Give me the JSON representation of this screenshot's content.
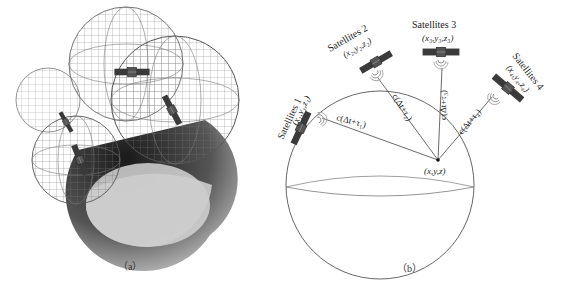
{
  "figure": {
    "panel_a": {
      "caption": "（a）",
      "description": "Overlapping wireframe spheres around Earth with satellites at their centers"
    },
    "panel_b": {
      "caption": "（b）",
      "receiver_label": "(x,y,z)",
      "satellites": [
        {
          "name": "Satellites 1",
          "coords": "(x₁,y₁,z₁)",
          "range": "c(Δt+τ₁)"
        },
        {
          "name": "Satellites 2",
          "coords": "(x₂,y₂,z₂)",
          "range": "c(Δt+τ₂)"
        },
        {
          "name": "Satellites 3",
          "coords": "(x₃,y₃,z₃)",
          "range": "c(Δt+τ₃)"
        },
        {
          "name": "Satellites 4",
          "coords": "(x₄,y₄,z₄)",
          "range": "c(Δt+τ₄)"
        }
      ]
    },
    "colors": {
      "line": "#555555",
      "wire": "#777777",
      "satellite_panel": "#333333",
      "earth_dark": "#2a2a2a",
      "earth_light": "#cfcfcf"
    }
  }
}
